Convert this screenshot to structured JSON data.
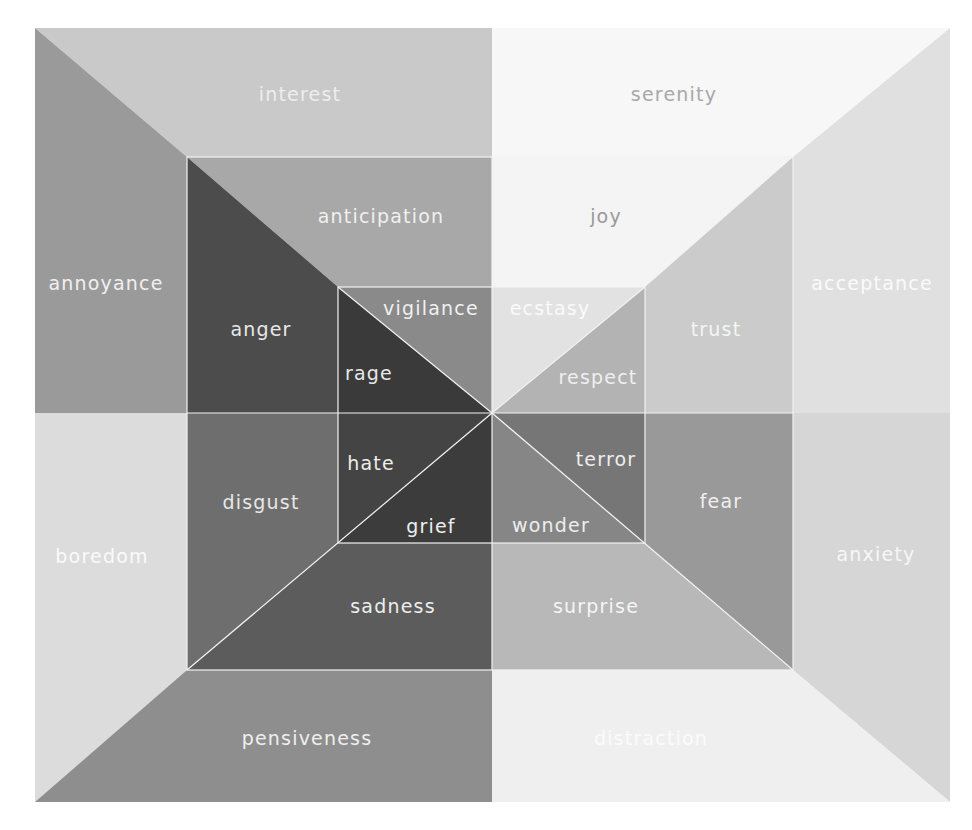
{
  "geometry": {
    "outer": [
      35,
      28,
      950,
      802
    ],
    "middle": [
      187,
      157,
      793,
      670
    ],
    "inner": [
      338,
      287,
      645,
      543
    ],
    "center": [
      492,
      413
    ]
  },
  "regions": [
    {
      "name": "interest",
      "points": "35,28 492,28 492,157 187,157",
      "fill": "#c9c9c9",
      "label_xy": [
        300,
        95
      ],
      "label_color": "#eeeeee"
    },
    {
      "name": "annoyance",
      "points": "35,28 187,157 187,413 35,413",
      "fill": "#9a9a9a",
      "label_xy": [
        106,
        284
      ],
      "label_color": "#f0f0f0"
    },
    {
      "name": "anticipation",
      "points": "187,157 492,157 492,287 338,287",
      "fill": "#a8a8a8",
      "label_xy": [
        381,
        217
      ],
      "label_color": "#f0f0f0"
    },
    {
      "name": "anger",
      "points": "187,157 338,287 338,413 187,413",
      "fill": "#4c4c4c",
      "label_xy": [
        261,
        330
      ],
      "label_color": "#e8e8e8"
    },
    {
      "name": "vigilance",
      "points": "338,287 492,287 492,413",
      "fill": "#8a8a8a",
      "label_xy": [
        431,
        309
      ],
      "label_color": "#f0f0f0"
    },
    {
      "name": "rage",
      "points": "338,287 492,413 338,413",
      "fill": "#3a3a3a",
      "label_xy": [
        369,
        374
      ],
      "label_color": "#e8e8e8"
    },
    {
      "name": "serenity",
      "points": "492,28 950,28 793,157 492,157",
      "fill": "#f7f7f7",
      "label_xy": [
        674,
        95
      ],
      "label_color": "#a8a8a8"
    },
    {
      "name": "acceptance",
      "points": "950,28 950,413 793,413 793,157",
      "fill": "#e0e0e0",
      "label_xy": [
        872,
        284
      ],
      "label_color": "#fafafa"
    },
    {
      "name": "joy",
      "points": "492,157 793,157 645,287 492,287",
      "fill": "#f4f4f4",
      "label_xy": [
        606,
        217
      ],
      "label_color": "#9a9a9a"
    },
    {
      "name": "trust",
      "points": "793,157 793,413 645,413 645,287",
      "fill": "#cbcbcb",
      "label_xy": [
        716,
        330
      ],
      "label_color": "#f5f5f5"
    },
    {
      "name": "ecstasy",
      "points": "492,287 645,287 492,413",
      "fill": "#e2e2e2",
      "label_xy": [
        550,
        309
      ],
      "label_color": "#fafafa"
    },
    {
      "name": "respect",
      "points": "645,287 645,413 492,413",
      "fill": "#b3b3b3",
      "label_xy": [
        598,
        378
      ],
      "label_color": "#efefef"
    },
    {
      "name": "boredom",
      "points": "35,413 187,413 187,670 35,802",
      "fill": "#dcdcdc",
      "label_xy": [
        102,
        557
      ],
      "label_color": "#fafafa"
    },
    {
      "name": "pensiveness",
      "points": "35,802 187,670 492,670 492,802",
      "fill": "#8e8e8e",
      "label_xy": [
        307,
        739
      ],
      "label_color": "#efefef"
    },
    {
      "name": "disgust",
      "points": "187,413 338,413 338,543 187,670",
      "fill": "#6e6e6e",
      "label_xy": [
        261,
        503
      ],
      "label_color": "#e8e8e8"
    },
    {
      "name": "sadness",
      "points": "187,670 338,543 492,543 492,670",
      "fill": "#5c5c5c",
      "label_xy": [
        393,
        607
      ],
      "label_color": "#eeeeee"
    },
    {
      "name": "hate",
      "points": "338,413 492,413 338,543",
      "fill": "#444444",
      "label_xy": [
        371,
        464
      ],
      "label_color": "#eeeeee"
    },
    {
      "name": "grief",
      "points": "338,543 492,413 492,543",
      "fill": "#3c3c3c",
      "label_xy": [
        431,
        527
      ],
      "label_color": "#eeeeee"
    },
    {
      "name": "anxiety",
      "points": "793,413 950,413 950,802 793,670",
      "fill": "#d6d6d6",
      "label_xy": [
        876,
        555
      ],
      "label_color": "#f7f7f7"
    },
    {
      "name": "distraction",
      "points": "492,670 793,670 950,802 492,802",
      "fill": "#efefef",
      "label_xy": [
        651,
        739
      ],
      "label_color": "#fbfbfb"
    },
    {
      "name": "fear",
      "points": "645,413 793,413 793,670 645,543",
      "fill": "#999999",
      "label_xy": [
        721,
        502
      ],
      "label_color": "#f0f0f0"
    },
    {
      "name": "surprise",
      "points": "492,543 645,543 793,670 492,670",
      "fill": "#b8b8b8",
      "label_xy": [
        596,
        607
      ],
      "label_color": "#f5f5f5"
    },
    {
      "name": "terror",
      "points": "492,413 645,413 645,543",
      "fill": "#767676",
      "label_xy": [
        606,
        460
      ],
      "label_color": "#eeeeee"
    },
    {
      "name": "wonder",
      "points": "492,413 645,543 492,543",
      "fill": "#868686",
      "label_xy": [
        551,
        526
      ],
      "label_color": "#eeeeee"
    }
  ]
}
